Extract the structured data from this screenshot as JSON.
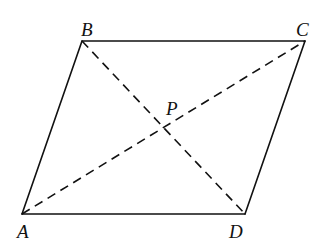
{
  "diagram": {
    "shape": "parallelogram",
    "stroke_color": "#111111",
    "background": "#ffffff",
    "vertices": {
      "A": {
        "label": "A",
        "x": 22,
        "y": 214
      },
      "B": {
        "label": "B",
        "x": 82,
        "y": 41
      },
      "C": {
        "label": "C",
        "x": 305,
        "y": 41
      },
      "D": {
        "label": "D",
        "x": 245,
        "y": 214
      }
    },
    "intersection": {
      "label": "P",
      "x": 163,
      "y": 128
    },
    "edges": [
      {
        "from": "A",
        "to": "B",
        "style": "solid"
      },
      {
        "from": "B",
        "to": "C",
        "style": "solid"
      },
      {
        "from": "C",
        "to": "D",
        "style": "solid"
      },
      {
        "from": "D",
        "to": "A",
        "style": "solid"
      }
    ],
    "diagonals": [
      {
        "from": "A",
        "to": "C",
        "style": "dashed"
      },
      {
        "from": "B",
        "to": "D",
        "style": "dashed"
      }
    ],
    "labels": {
      "A": "A",
      "B": "B",
      "C": "C",
      "D": "D",
      "P": "P"
    }
  }
}
